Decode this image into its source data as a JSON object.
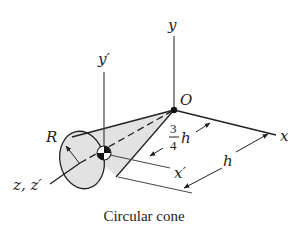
{
  "figure": {
    "caption": "Circular cone",
    "shape": "circular-cone",
    "labels": {
      "y_axis": "y",
      "y_prime_axis": "y′",
      "x_axis": "x",
      "x_prime_axis": "x′",
      "z_axes": "z, z′",
      "origin": "O",
      "radius": "R",
      "centroid_distance_numerator": "3",
      "centroid_distance_denominator": "4",
      "centroid_distance_var": "h",
      "height": "h"
    },
    "colors": {
      "line": "#222222",
      "cone_fill": "#e2e2e2",
      "background": "#ffffff"
    }
  }
}
